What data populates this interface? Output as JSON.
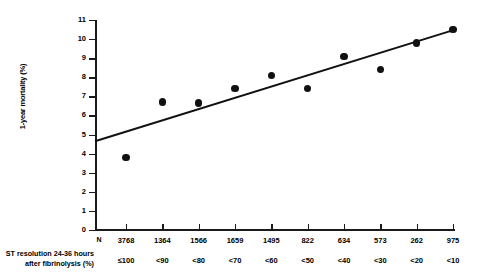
{
  "chart_data": {
    "type": "scatter",
    "title": "",
    "xlabel": "ST resolution 24-36 hours after fibrinolysis (%)",
    "ylabel": "1-year mortality (%)",
    "ylim": [
      0,
      11
    ],
    "ytick_labels": [
      "0",
      "1",
      "2",
      "3",
      "4",
      "5",
      "6",
      "7",
      "8",
      "9",
      "10",
      "11"
    ],
    "ytick_values": [
      0,
      1,
      2,
      3,
      4,
      5,
      6,
      7,
      8,
      9,
      10,
      11
    ],
    "grid": false,
    "legend": null,
    "categories": [
      "≤100",
      "<90",
      "<80",
      "<70",
      "<60",
      "<50",
      "<40",
      "<30",
      "<20",
      "<10"
    ],
    "values": [
      3.8,
      6.7,
      6.65,
      7.4,
      8.1,
      7.4,
      9.1,
      8.4,
      9.8,
      10.5
    ],
    "n_header": "N",
    "n_values": [
      "3768",
      "1364",
      "1566",
      "1659",
      "1495",
      "822",
      "634",
      "573",
      "262",
      "975"
    ],
    "trendline": {
      "type": "linear",
      "y_start": 4.65,
      "y_end": 10.5
    }
  },
  "axis": {
    "y_label": "1-year mortality (%)"
  },
  "row_labels": {
    "caption_line1": "ST resolution 24-36 hours",
    "caption_line2": "after fibrinolysis (%)"
  },
  "colors": {
    "marker": "#111111",
    "axis": "#1a1a1a",
    "line": "#111111",
    "background": "#ffffff"
  }
}
